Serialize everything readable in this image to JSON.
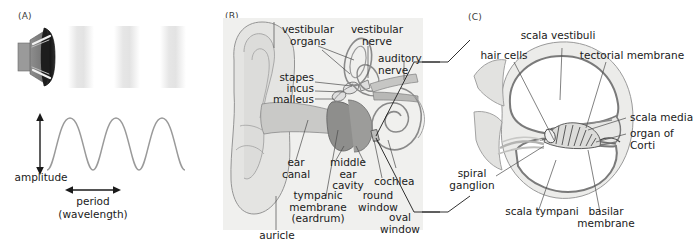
{
  "figure": {
    "panels": [
      {
        "tag": "(A)",
        "name": "sound-wave-panel",
        "labels": [
          {
            "key": "amplitude",
            "text": "amplitude"
          },
          {
            "key": "period",
            "text": "period"
          },
          {
            "key": "wavelength",
            "text": "(wavelength)"
          }
        ],
        "elements": {
          "speaker": "loudspeaker-icon",
          "wave_bands": 3,
          "wave_cycles": 3
        }
      },
      {
        "tag": "(B)",
        "name": "ear-anatomy-panel",
        "labels": [
          {
            "key": "vestibular_organs",
            "text": "vestibular\norgans"
          },
          {
            "key": "vestibular_nerve",
            "text": "vestibular\nnerve"
          },
          {
            "key": "auditory_nerve",
            "text": "auditory\nnerve"
          },
          {
            "key": "stapes",
            "text": "stapes"
          },
          {
            "key": "incus",
            "text": "incus"
          },
          {
            "key": "malleus",
            "text": "malleus"
          },
          {
            "key": "ear_canal",
            "text": "ear\ncanal"
          },
          {
            "key": "middle_ear_cavity",
            "text": "middle\near\ncavity"
          },
          {
            "key": "tympanic_membrane",
            "text": "tympanic\nmembrane\n(eardrum)"
          },
          {
            "key": "round_window",
            "text": "round\nwindow"
          },
          {
            "key": "oval_window",
            "text": "oval\nwindow"
          },
          {
            "key": "cochlea",
            "text": "cochlea"
          },
          {
            "key": "auricle",
            "text": "auricle"
          }
        ]
      },
      {
        "tag": "(C)",
        "name": "cochlea-cross-section-panel",
        "labels": [
          {
            "key": "scala_vestibuli",
            "text": "scala vestibuli"
          },
          {
            "key": "hair_cells",
            "text": "hair cells"
          },
          {
            "key": "tectorial_membrane",
            "text": "tectorial membrane"
          },
          {
            "key": "scala_media",
            "text": "scala media"
          },
          {
            "key": "organ_of_corti",
            "text": "organ of\nCorti"
          },
          {
            "key": "spiral_ganglion",
            "text": "spiral\nganglion"
          },
          {
            "key": "scala_tympani",
            "text": "scala tympani"
          },
          {
            "key": "basilar_membrane",
            "text": "basilar\nmembrane"
          }
        ]
      }
    ],
    "colors": {
      "panel_b_background": "#f0f0ee",
      "panel_c_background": "#ffffff",
      "wave_stroke": "#9a9a9a",
      "band_fill": "#e9e9e9",
      "tissue_light": "#e4e4e2",
      "tissue_mid": "#c9c9c7",
      "tissue_dark": "#8e8e8c",
      "outline": "#6e6e6e",
      "leader_line": "#4a4a4a",
      "text": "#1a1a1a"
    }
  }
}
